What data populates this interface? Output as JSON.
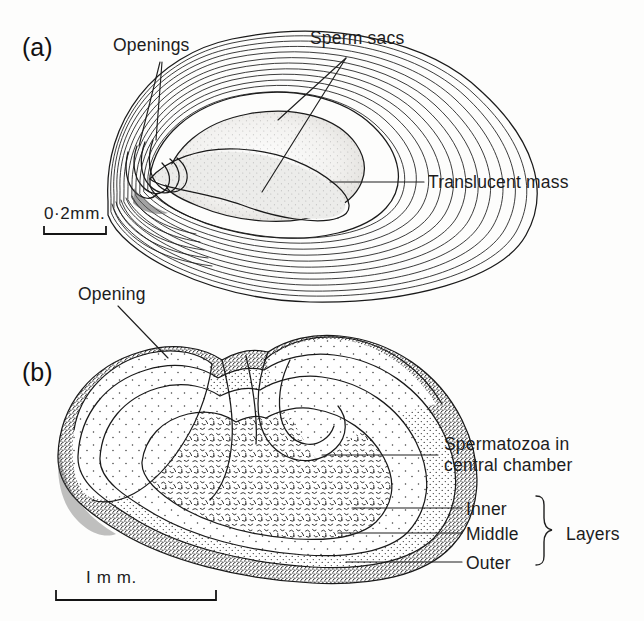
{
  "figure": {
    "background_color": "#fdfdfc",
    "ink_color": "#1a1a1a"
  },
  "panels": [
    {
      "id": "a",
      "panel_label": "(a)",
      "scale_bar": {
        "label": "0·2mm.",
        "value": 0.2,
        "unit": "mm"
      },
      "labels": [
        {
          "key": "openings",
          "text": "Openings"
        },
        {
          "key": "sperm_sacs",
          "text": "Sperm  sacs"
        },
        {
          "key": "translucent_mass",
          "text": "Translucent mass"
        }
      ]
    },
    {
      "id": "b",
      "panel_label": "(b)",
      "scale_bar": {
        "label": "I m m.",
        "value": 1,
        "unit": "mm"
      },
      "labels": [
        {
          "key": "opening",
          "text": "Opening"
        },
        {
          "key": "spermatozoa1",
          "text": "Spermatozoa in"
        },
        {
          "key": "spermatozoa2",
          "text": "central chamber"
        },
        {
          "key": "inner",
          "text": "Inner"
        },
        {
          "key": "middle",
          "text": "Middle"
        },
        {
          "key": "outer",
          "text": "Outer"
        },
        {
          "key": "layers",
          "text": "Layers"
        }
      ]
    }
  ],
  "text": {
    "panel_a_label": "(a)",
    "panel_b_label": "(b)",
    "openings": "Openings",
    "sperm_sacs": "Sperm  sacs",
    "translucent_mass": "Translucent mass",
    "scale_a": "0·2mm.",
    "opening": "Opening",
    "spermatozoa_line1": "Spermatozoa in",
    "spermatozoa_line2": "central chamber",
    "inner": "Inner",
    "middle": "Middle",
    "outer": "Outer",
    "layers": "Layers",
    "scale_b": "I m m."
  }
}
